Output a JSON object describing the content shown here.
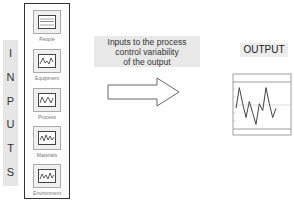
{
  "inputs_label": {
    "letters": [
      "I",
      "N",
      "P",
      "U",
      "T",
      "S"
    ]
  },
  "factors": [
    {
      "label": "People",
      "icon": "monitor-bars-icon"
    },
    {
      "label": "Equipment",
      "icon": "monitor-wave-icon"
    },
    {
      "label": "Process",
      "icon": "monitor-wave-icon"
    },
    {
      "label": "Materials",
      "icon": "monitor-wave-icon"
    },
    {
      "label": "Environment",
      "icon": "monitor-wave-icon"
    }
  ],
  "caption": {
    "line1": "Inputs to the process",
    "line2": "control variability",
    "line3": "of the output"
  },
  "arrow": {
    "direction": "right",
    "fill": "#ffffff",
    "stroke": "#555555"
  },
  "output": {
    "label": "OUTPUT",
    "chart_title": "",
    "chart_series": [
      0.45,
      0.9,
      0.55,
      0.25,
      0.6,
      0.35,
      0.1,
      0.55,
      0.4,
      0.9,
      0.55,
      0.25,
      0.45
    ]
  },
  "colors": {
    "label_background": "#e6e6e6",
    "border": "#333333",
    "line": "#555555"
  }
}
